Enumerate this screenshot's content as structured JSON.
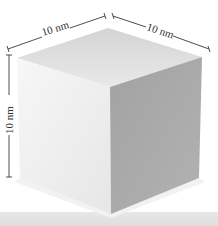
{
  "figure": {
    "labels": {
      "top_left_edge": "10 nm",
      "top_right_edge": "10 nm",
      "vertical_edge": "10 nm"
    },
    "colors": {
      "background": "#ffffff",
      "top_face": "#e2e2e2",
      "left_face": "#efefef",
      "right_face": "#a8a8a8",
      "dimension_line": "#3a3a3a",
      "bottom_strip": "#e4e4e4"
    }
  }
}
